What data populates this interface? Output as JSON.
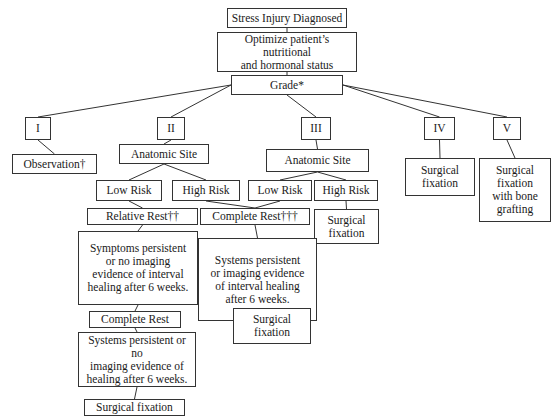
{
  "diagram": {
    "nodes": {
      "diagnosed": "Stress Injury Diagnosed",
      "optimize": "Optimize patient’s nutritional\nand hormonal status",
      "grade": "Grade*",
      "grade_i": "I",
      "grade_ii": "II",
      "grade_iii": "III",
      "grade_iv": "IV",
      "grade_v": "V",
      "observation": "Observation†",
      "anatomic_site_ii": "Anatomic Site",
      "anatomic_site_iii": "Anatomic Site",
      "low_risk_ii": "Low Risk",
      "high_risk_ii": "High Risk",
      "low_risk_iii": "Low Risk",
      "high_risk_iii": "High Risk",
      "relative_rest": "Relative Rest††",
      "complete_rest_mid": "Complete Rest†††",
      "surgical_fixation_high_iii": "Surgical\nfixation",
      "surgical_fixation_iv": "Surgical\nfixation",
      "surgical_fixation_v": "Surgical\nfixation\nwith bone\ngrafting",
      "symptoms_persistent": "Symptoms persistent\nor no imaging\nevidence of interval\nhealing after 6 weeks.",
      "systems_persistent_mid": "Systems persistent\nor imaging evidence\nof interval healing\nafter 6 weeks.",
      "complete_rest_left": "Complete Rest",
      "surgical_fixation_mid": "Surgical\nfixation",
      "systems_persistent_left": "Systems persistent or no\nimaging evidence of\nhealing after 6 weeks.",
      "surgical_fixation_left": "Surgical fixation"
    },
    "edges": [
      [
        "diagnosed",
        "optimize"
      ],
      [
        "optimize",
        "grade"
      ],
      [
        "grade",
        "grade_i"
      ],
      [
        "grade",
        "grade_ii"
      ],
      [
        "grade",
        "grade_iii"
      ],
      [
        "grade",
        "grade_iv"
      ],
      [
        "grade",
        "grade_v"
      ],
      [
        "grade_i",
        "observation"
      ],
      [
        "grade_ii",
        "anatomic_site_ii"
      ],
      [
        "grade_iii",
        "anatomic_site_iii"
      ],
      [
        "grade_iv",
        "surgical_fixation_iv"
      ],
      [
        "grade_v",
        "surgical_fixation_v"
      ],
      [
        "anatomic_site_ii",
        "low_risk_ii"
      ],
      [
        "anatomic_site_ii",
        "high_risk_ii"
      ],
      [
        "anatomic_site_iii",
        "low_risk_iii"
      ],
      [
        "anatomic_site_iii",
        "high_risk_iii"
      ],
      [
        "low_risk_ii",
        "relative_rest"
      ],
      [
        "high_risk_ii",
        "complete_rest_mid"
      ],
      [
        "low_risk_iii",
        "complete_rest_mid"
      ],
      [
        "high_risk_iii",
        "surgical_fixation_high_iii"
      ],
      [
        "relative_rest",
        "symptoms_persistent"
      ],
      [
        "complete_rest_mid",
        "systems_persistent_mid"
      ],
      [
        "symptoms_persistent",
        "complete_rest_left"
      ],
      [
        "systems_persistent_mid",
        "surgical_fixation_mid"
      ],
      [
        "complete_rest_left",
        "systems_persistent_left"
      ],
      [
        "systems_persistent_left",
        "surgical_fixation_left"
      ]
    ]
  }
}
